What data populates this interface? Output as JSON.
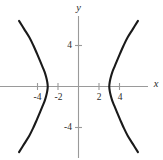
{
  "figure": {
    "background_color": "#ffffff",
    "width": 163,
    "height": 160
  },
  "chart_data": {
    "type": "line",
    "title": "",
    "subtitle": "",
    "xlabel": "x",
    "ylabel": "y",
    "xlim": [
      -6.3,
      6.3
    ],
    "ylim": [
      -6.4,
      6.4
    ],
    "grid": false,
    "legend": null,
    "axes_color": "#9a9a9a",
    "curve_color": "#1a1a1a",
    "text_color": "#2b2b2b",
    "xticks": [
      -4,
      -2,
      2,
      4
    ],
    "xtick_labels": [
      "-4",
      "-2",
      "2",
      "4"
    ],
    "yticks": [
      4,
      -4
    ],
    "ytick_labels": [
      "4",
      "-4"
    ],
    "series": [
      {
        "name": "left-branch",
        "vertex": [
          -3,
          0
        ],
        "points": [
          [
            -5.8,
            6.4
          ],
          [
            -5.3,
            5.6
          ],
          [
            -4.8,
            4.8
          ],
          [
            -4.4,
            4.0
          ],
          [
            -4.05,
            3.2
          ],
          [
            -3.75,
            2.5
          ],
          [
            -3.5,
            1.9
          ],
          [
            -3.3,
            1.4
          ],
          [
            -3.15,
            0.9
          ],
          [
            -3.05,
            0.45
          ],
          [
            -3.0,
            0.0
          ],
          [
            -3.05,
            -0.45
          ],
          [
            -3.15,
            -0.9
          ],
          [
            -3.3,
            -1.4
          ],
          [
            -3.5,
            -1.9
          ],
          [
            -3.75,
            -2.5
          ],
          [
            -4.05,
            -3.2
          ],
          [
            -4.4,
            -4.0
          ],
          [
            -4.8,
            -4.8
          ],
          [
            -5.3,
            -5.6
          ],
          [
            -5.8,
            -6.4
          ]
        ]
      },
      {
        "name": "right-branch",
        "vertex": [
          3,
          0
        ],
        "points": [
          [
            5.8,
            6.4
          ],
          [
            5.3,
            5.6
          ],
          [
            4.8,
            4.8
          ],
          [
            4.4,
            4.0
          ],
          [
            4.05,
            3.2
          ],
          [
            3.75,
            2.5
          ],
          [
            3.5,
            1.9
          ],
          [
            3.3,
            1.4
          ],
          [
            3.15,
            0.9
          ],
          [
            3.05,
            0.45
          ],
          [
            3.0,
            0.0
          ],
          [
            3.05,
            -0.45
          ],
          [
            3.15,
            -0.9
          ],
          [
            3.3,
            -1.4
          ],
          [
            3.5,
            -1.9
          ],
          [
            3.75,
            -2.5
          ],
          [
            4.05,
            -3.2
          ],
          [
            4.4,
            -4.0
          ],
          [
            4.8,
            -4.8
          ],
          [
            5.3,
            -5.6
          ],
          [
            5.8,
            -6.4
          ]
        ]
      }
    ]
  }
}
